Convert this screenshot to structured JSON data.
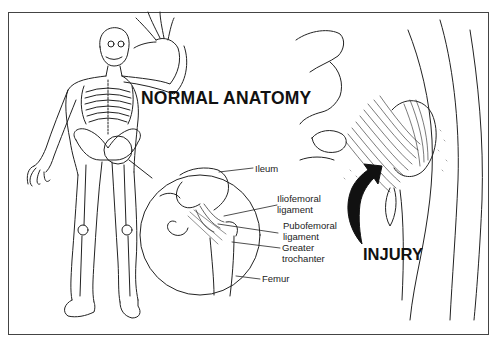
{
  "figure": {
    "titles": {
      "normal": "NORMAL ANATOMY",
      "injury": "INJURY"
    },
    "labels": [
      {
        "id": "ileum",
        "text": "Ileum"
      },
      {
        "id": "iliofemoral",
        "line1": "Iliofemoral",
        "line2": "ligament"
      },
      {
        "id": "pubofemoral",
        "line1": "Pubofemoral",
        "line2": "ligament"
      },
      {
        "id": "greater-trochanter",
        "line1": "Greater",
        "line2": "trochanter"
      },
      {
        "id": "femur",
        "text": "Femur"
      }
    ],
    "panels": [
      "full-body-skeleton",
      "hip-joint-magnified-circle",
      "injured-hip-closeup"
    ],
    "colors": {
      "line": "#222222",
      "background": "#ffffff",
      "frame": "#444444"
    }
  }
}
